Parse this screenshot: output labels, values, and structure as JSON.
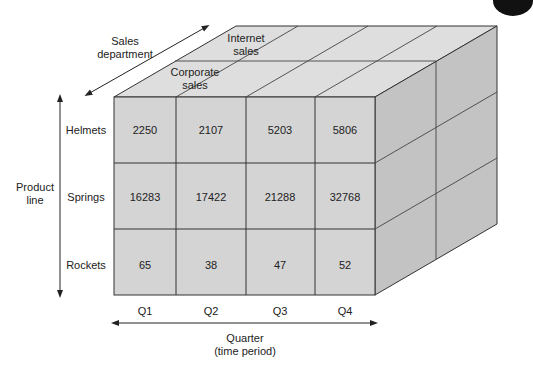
{
  "colors": {
    "front_face": "#d4d4d4",
    "top_face": "#dedede",
    "side_face": "#c3c3c3",
    "line": "#333333",
    "background": "#ffffff"
  },
  "axes": {
    "depth": {
      "label_line1": "Sales",
      "label_line2": "department"
    },
    "vertical": {
      "label_line1": "Product",
      "label_line2": "line"
    },
    "horizontal": {
      "label_line1": "Quarter",
      "label_line2": "(time period)"
    }
  },
  "depth_slices": [
    {
      "line1": "Corporate",
      "line2": "sales"
    },
    {
      "line1": "Internet",
      "line2": "sales"
    }
  ],
  "products": [
    "Helmets",
    "Springs",
    "Rockets"
  ],
  "quarters": [
    "Q1",
    "Q2",
    "Q3",
    "Q4"
  ],
  "cells": [
    [
      "2250",
      "2107",
      "5203",
      "5806"
    ],
    [
      "16283",
      "17422",
      "21288",
      "32768"
    ],
    [
      "65",
      "38",
      "47",
      "52"
    ]
  ]
}
